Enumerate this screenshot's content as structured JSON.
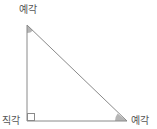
{
  "diagram": {
    "type": "right-triangle",
    "labels": {
      "top_angle": "예각",
      "right_angle": "직각",
      "bottom_right_angle": "예각"
    },
    "colors": {
      "line": "#8a8a8a",
      "angle_fill": "#b0b0b0",
      "text": "#555555"
    }
  }
}
